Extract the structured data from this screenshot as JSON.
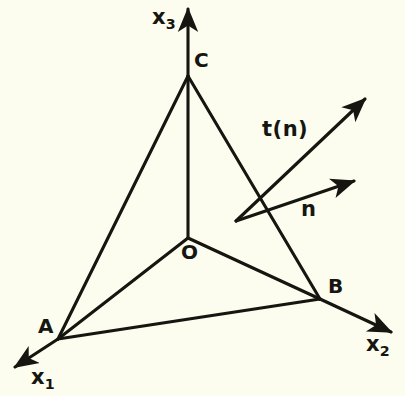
{
  "figure": {
    "background_color": "#fcfcef",
    "stroke_color": "#161611",
    "axes": [
      {
        "name": "x1",
        "label_text": "x",
        "subscript": "1",
        "from": [
          58,
          339
        ],
        "to": [
          12,
          369
        ]
      },
      {
        "name": "x2",
        "label_text": "x",
        "subscript": "2",
        "from": [
          320,
          299
        ],
        "to": [
          394,
          334
        ]
      },
      {
        "name": "x3",
        "label_text": "x",
        "subscript": "3",
        "from": [
          188,
          238
        ],
        "to": [
          188,
          6
        ]
      }
    ],
    "vertices": [
      {
        "name": "O",
        "label": "O",
        "x": 188,
        "y": 238
      },
      {
        "name": "A",
        "label": "A",
        "x": 58,
        "y": 339
      },
      {
        "name": "B",
        "label": "B",
        "x": 320,
        "y": 299
      },
      {
        "name": "C",
        "label": "C",
        "x": 188,
        "y": 76
      }
    ],
    "edges": [
      {
        "name": "edge-O-A",
        "from": [
          188,
          238
        ],
        "to": [
          58,
          339
        ]
      },
      {
        "name": "edge-O-B",
        "from": [
          188,
          238
        ],
        "to": [
          320,
          299
        ]
      },
      {
        "name": "edge-A-B",
        "from": [
          58,
          339
        ],
        "to": [
          320,
          299
        ]
      },
      {
        "name": "edge-A-C",
        "from": [
          58,
          339
        ],
        "to": [
          188,
          76
        ]
      },
      {
        "name": "edge-C-B",
        "from": [
          188,
          76
        ],
        "to": [
          320,
          299
        ]
      }
    ],
    "vectors": [
      {
        "name": "traction-vector",
        "label": "t(n)",
        "from": [
          236,
          221
        ],
        "to": [
          368,
          96
        ],
        "label_x": 262,
        "label_y": 119
      },
      {
        "name": "normal-vector",
        "label": "n",
        "from": [
          236,
          221
        ],
        "to": [
          357,
          180
        ],
        "label_x": 301,
        "label_y": 199
      }
    ],
    "axis_labels": [
      {
        "name": "x1-label",
        "x": 31,
        "y": 367
      },
      {
        "name": "x2-label",
        "x": 366,
        "y": 334
      },
      {
        "name": "x3-label",
        "x": 152,
        "y": 7
      }
    ],
    "vertex_labels": [
      {
        "name": "O-label",
        "x": 181,
        "y": 242
      },
      {
        "name": "A-label",
        "x": 38,
        "y": 316
      },
      {
        "name": "B-label",
        "x": 328,
        "y": 276
      },
      {
        "name": "C-label",
        "x": 194,
        "y": 50
      }
    ]
  }
}
